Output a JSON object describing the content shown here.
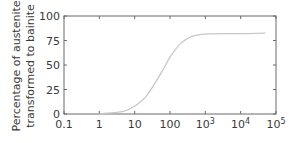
{
  "chart_data": {
    "type": "line",
    "title": "",
    "xlabel": "",
    "ylabel": [
      "Percentage of austenite",
      "transformed to bainite"
    ],
    "xscale": "log",
    "xlim": [
      0.1,
      100000
    ],
    "ylim": [
      0,
      100
    ],
    "x_ticks": [
      "0.1",
      "1",
      "10",
      "100",
      "10^3",
      "10^4",
      "10^5"
    ],
    "y_ticks": [
      "0",
      "25",
      "50",
      "75",
      "100"
    ],
    "grid": false,
    "legend": null,
    "series": [
      {
        "name": "bainite transformation",
        "x": [
          1,
          2,
          5,
          10,
          20,
          40,
          70,
          100,
          200,
          400,
          700,
          1000,
          3000,
          10000,
          50000
        ],
        "y": [
          0,
          1,
          3,
          8,
          17,
          33,
          48,
          58,
          72,
          79,
          81,
          81.5,
          82,
          82,
          82.5
        ]
      }
    ],
    "colors": {
      "line": "#c8c8c8",
      "axis": "#6a6a6a"
    }
  }
}
